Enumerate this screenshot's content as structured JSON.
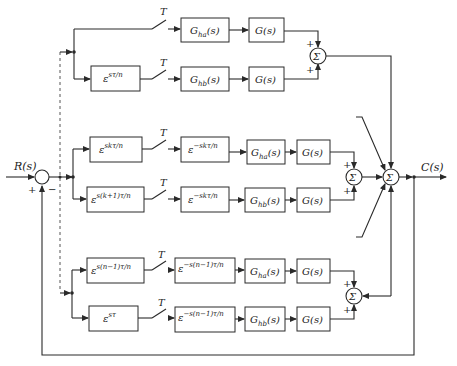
{
  "diagram": {
    "input_label": "R(s)",
    "output_label": "C(s)",
    "sampler_label": "T",
    "sum_symbol": "Σ",
    "plus": "+",
    "minus": "−",
    "branches": [
      {
        "id": "branch-0",
        "advance": "",
        "delay": "",
        "hold": {
          "base": "G",
          "sub": "ha",
          "arg": "(s)"
        },
        "plant": "G(s)"
      },
      {
        "id": "branch-1",
        "advance": {
          "base": "ε",
          "sup": "sτ/n"
        },
        "delay": "",
        "hold": {
          "base": "G",
          "sub": "hb",
          "arg": "(s)"
        },
        "plant": "G(s)"
      },
      {
        "id": "branch-k-a",
        "advance": {
          "base": "ε",
          "sup": "skτ/n"
        },
        "delay": {
          "base": "ε",
          "sup": "−skτ/n"
        },
        "hold": {
          "base": "G",
          "sub": "ha",
          "arg": "(s)"
        },
        "plant": "G(s)"
      },
      {
        "id": "branch-k-b",
        "advance": {
          "base": "ε",
          "sup": "s(k+1)τ/n"
        },
        "delay": {
          "base": "ε",
          "sup": "−skτ/n"
        },
        "hold": {
          "base": "G",
          "sub": "hb",
          "arg": "(s)"
        },
        "plant": "G(s)"
      },
      {
        "id": "branch-n-a",
        "advance": {
          "base": "ε",
          "sup": "s(n−1)τ/n"
        },
        "delay": {
          "base": "ε",
          "sup": "−s(n−1)τ/n"
        },
        "hold": {
          "base": "G",
          "sub": "ha",
          "arg": "(s)"
        },
        "plant": "G(s)"
      },
      {
        "id": "branch-n-b",
        "advance": {
          "base": "ε",
          "sup": "sτ"
        },
        "delay": {
          "base": "ε",
          "sup": "−s(n−1)τ/n"
        },
        "hold": {
          "base": "G",
          "sub": "hb",
          "arg": "(s)"
        },
        "plant": "G(s)"
      }
    ]
  }
}
